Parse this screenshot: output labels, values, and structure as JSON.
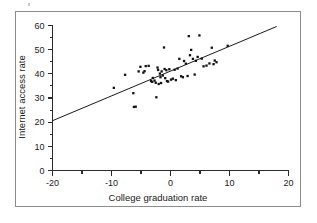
{
  "figure": {
    "border_color": "#8c8c8c",
    "background": "#ffffff"
  },
  "chart_data": {
    "type": "scatter",
    "title": "",
    "xlabel": "College graduation rate",
    "ylabel": "Internet access rate",
    "xlim": [
      -20,
      20
    ],
    "ylim": [
      0,
      60
    ],
    "grid": false,
    "legend": null,
    "x_ticks_major": [
      -20,
      -10,
      0,
      10,
      20
    ],
    "x_ticks_minor": [
      -15,
      -5,
      5,
      15
    ],
    "x_tick_labels": [
      "-20",
      "-10",
      "0",
      "10",
      "20"
    ],
    "y_ticks_major": [
      0,
      10,
      20,
      30,
      40,
      50,
      60
    ],
    "y_ticks_minor": [
      5,
      15,
      25,
      35,
      45,
      55
    ],
    "y_tick_labels": [
      "0",
      "10",
      "20",
      "30",
      "40",
      "50",
      "60"
    ],
    "marker": "filled-square",
    "marker_color": "#111111",
    "points": [
      [
        -9.6,
        34.2
      ],
      [
        -7.7,
        39.6
      ],
      [
        -6.3,
        32.0
      ],
      [
        -6.2,
        26.3
      ],
      [
        -5.9,
        26.4
      ],
      [
        -5.4,
        41.0
      ],
      [
        -5.1,
        42.9
      ],
      [
        -4.6,
        40.5
      ],
      [
        -4.4,
        41.1
      ],
      [
        -4.2,
        43.2
      ],
      [
        -3.7,
        43.3
      ],
      [
        -3.3,
        37.0
      ],
      [
        -3.1,
        36.7
      ],
      [
        -3.0,
        38.3
      ],
      [
        -2.7,
        37.2
      ],
      [
        -2.5,
        36.3
      ],
      [
        -2.4,
        30.3
      ],
      [
        -2.2,
        42.6
      ],
      [
        -2.1,
        41.6
      ],
      [
        -2.0,
        35.8
      ],
      [
        -1.8,
        40.1
      ],
      [
        -1.7,
        38.6
      ],
      [
        -1.6,
        36.2
      ],
      [
        -1.5,
        41.0
      ],
      [
        -1.3,
        39.3
      ],
      [
        -1.1,
        50.9
      ],
      [
        -1.0,
        42.0
      ],
      [
        -0.9,
        38.2
      ],
      [
        -0.7,
        41.5
      ],
      [
        -0.6,
        37.0
      ],
      [
        -0.4,
        36.8
      ],
      [
        -0.2,
        41.9
      ],
      [
        0.1,
        37.6
      ],
      [
        0.4,
        38.0
      ],
      [
        0.7,
        41.7
      ],
      [
        0.9,
        37.4
      ],
      [
        1.2,
        42.2
      ],
      [
        1.5,
        46.2
      ],
      [
        1.8,
        39.0
      ],
      [
        2.1,
        38.6
      ],
      [
        2.3,
        45.3
      ],
      [
        2.6,
        44.2
      ],
      [
        2.9,
        39.1
      ],
      [
        3.1,
        55.6
      ],
      [
        3.3,
        47.7
      ],
      [
        3.5,
        49.9
      ],
      [
        3.8,
        46.2
      ],
      [
        4.1,
        39.7
      ],
      [
        4.3,
        45.4
      ],
      [
        4.6,
        47.0
      ],
      [
        4.9,
        55.9
      ],
      [
        5.3,
        46.3
      ],
      [
        5.6,
        43.1
      ],
      [
        6.1,
        43.4
      ],
      [
        6.6,
        44.3
      ],
      [
        7.0,
        50.8
      ],
      [
        7.3,
        44.0
      ],
      [
        7.5,
        45.5
      ],
      [
        7.8,
        44.8
      ],
      [
        9.7,
        51.6
      ]
    ],
    "fit_line": {
      "type": "linear",
      "x_start": -20,
      "y_start": 20.6,
      "x_end": 18.0,
      "y_end": 59.6,
      "color": "#1a1a1a"
    }
  }
}
